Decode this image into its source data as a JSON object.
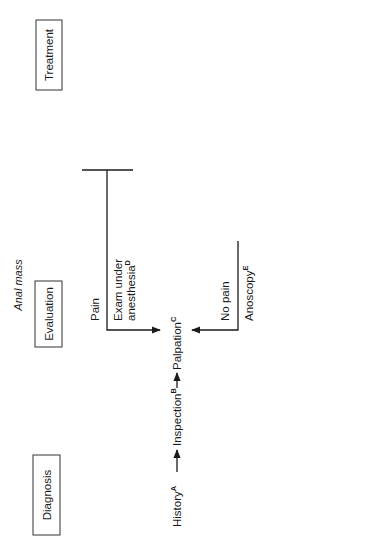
{
  "title": "Anal mass",
  "sections": {
    "diagnosis": "Diagnosis",
    "evaluation": "Evaluation",
    "treatment": "Treatment"
  },
  "diagnosis_steps": [
    {
      "label": "History",
      "sup": "A"
    },
    {
      "label": "Inspection",
      "sup": "B"
    },
    {
      "label": "Palpation",
      "sup": "C"
    }
  ],
  "branches": {
    "pain": {
      "condition": "Pain",
      "evaluation": {
        "lines": [
          "Exam under",
          "anesthesia"
        ],
        "sup": "D"
      },
      "findings": [
        {
          "lines": [
            "Abscess"
          ],
          "sup": "F",
          "treatments": [
            {
              "lines": [
                "Incision and",
                "drainage"
              ],
              "sup": "L"
            }
          ]
        },
        {
          "lines": [
            "Thrombosed",
            "external",
            "hemorrhoid"
          ],
          "sup": "G",
          "treatments": [
            {
              "lines": [
                "Excision"
              ],
              "sup": "M"
            },
            {
              "lines": [
                "Conservative"
              ],
              "sup": "N"
            }
          ]
        }
      ]
    },
    "no_pain": {
      "condition": "No pain",
      "evaluation": {
        "lines": [
          "Anoscopy"
        ],
        "sup": "E"
      },
      "findings": [
        {
          "lines": [
            "Condyloma"
          ],
          "sup": "H",
          "treatments": [
            {
              "lines": [
                "Excision",
                "Fulgeration"
              ],
              "sup": "O"
            }
          ]
        },
        {
          "lines": [
            "Neoplasm"
          ],
          "sup": "I",
          "treatments": [
            {
              "lines": [
                "Biopsy"
              ],
              "sup": "P"
            }
          ]
        },
        {
          "lines": [
            "Hypertrophied",
            "anal papilla"
          ],
          "sup": "J",
          "treatments": [
            {
              "lines": [
                "Excision"
              ],
              "sup": "Q"
            },
            {
              "lines": [
                "Conservative"
              ],
              "sup": "R"
            }
          ]
        },
        {
          "lines": [
            "Fistula"
          ],
          "sup": "K",
          "treatments": [
            {
              "lines": [
                "Fistulotomy"
              ],
              "sup": "S"
            },
            {
              "lines": [
                "Seton"
              ],
              "sup": "T"
            },
            {
              "lines": [
                "Advancement flap"
              ],
              "sup": "U"
            }
          ]
        }
      ]
    }
  }
}
